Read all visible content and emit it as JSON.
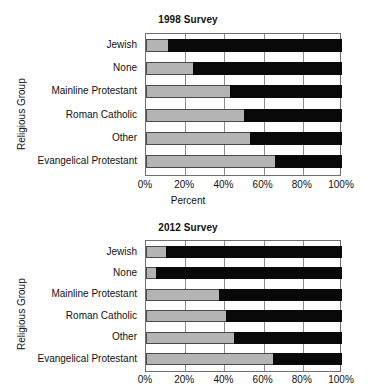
{
  "chart_data": [
    {
      "type": "bar",
      "orientation": "horizontal",
      "stacked": true,
      "normalized": true,
      "title": "1998 Survey",
      "xlabel": "Percent",
      "ylabel": "Religious Group",
      "categories": [
        "Jewish",
        "None",
        "Mainline Protestant",
        "Roman Catholic",
        "Other",
        "Evangelical Protestant"
      ],
      "xlim": [
        0,
        100
      ],
      "xticks": [
        0,
        20,
        40,
        60,
        80,
        100
      ],
      "xticklabels": [
        "0%",
        "20%",
        "40%",
        "60%",
        "80%",
        "100%"
      ],
      "grid": "vertical",
      "legend": "none",
      "series": [
        {
          "name": "light",
          "color": "#b4b4b4",
          "values": [
            11,
            24,
            43,
            50,
            53,
            66
          ]
        },
        {
          "name": "dark",
          "color": "#090909",
          "values": [
            89,
            76,
            57,
            50,
            47,
            34
          ]
        }
      ]
    },
    {
      "type": "bar",
      "orientation": "horizontal",
      "stacked": true,
      "normalized": true,
      "title": "2012 Survey",
      "xlabel": "",
      "ylabel": "Religious Group",
      "categories": [
        "Jewish",
        "None",
        "Mainline Protestant",
        "Roman Catholic",
        "Other",
        "Evangelical Protestant"
      ],
      "xlim": [
        0,
        100
      ],
      "xticks": [
        0,
        20,
        40,
        60,
        80,
        100
      ],
      "xticklabels": [
        "0%",
        "20%",
        "40%",
        "60%",
        "80%",
        "100%"
      ],
      "grid": "vertical",
      "legend": "none",
      "series": [
        {
          "name": "light",
          "color": "#b4b4b4",
          "values": [
            10,
            5,
            37,
            41,
            45,
            65
          ]
        },
        {
          "name": "dark",
          "color": "#090909",
          "values": [
            90,
            95,
            63,
            59,
            55,
            35
          ]
        }
      ]
    }
  ],
  "chart1": {
    "title": "1998 Survey",
    "ylabel": "Religious Group",
    "xlabel": "Percent",
    "categories": [
      "Jewish",
      "None",
      "Mainline Protestant",
      "Roman Catholic",
      "Other",
      "Evangelical Protestant"
    ],
    "xticklabels": [
      "0%",
      "20%",
      "40%",
      "60%",
      "80%",
      "100%"
    ]
  },
  "chart2": {
    "title": "2012 Survey",
    "ylabel": "Religious Group",
    "xlabel": "",
    "categories": [
      "Jewish",
      "None",
      "Mainline Protestant",
      "Roman Catholic",
      "Other",
      "Evangelical Protestant"
    ],
    "xticklabels": [
      "0%",
      "20%",
      "40%",
      "60%",
      "80%",
      "100%"
    ]
  },
  "colors": {
    "light_segment": "#b4b4b4",
    "dark_segment": "#090909",
    "axis": "#6f6f6f",
    "grid": "#8d8d8d",
    "background": "#ffffff",
    "text": "#111111"
  }
}
